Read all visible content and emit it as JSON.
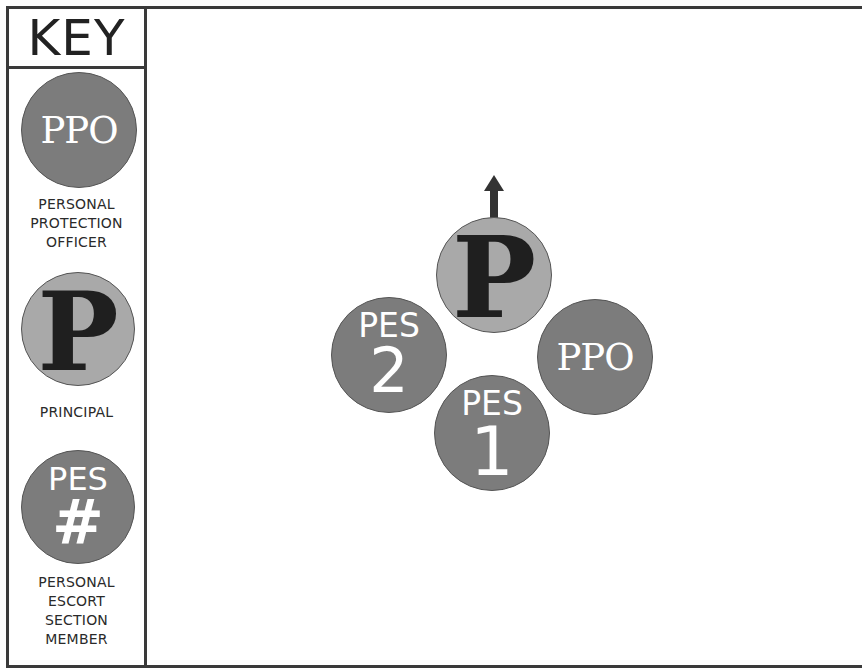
{
  "key": {
    "title": "KEY",
    "items": [
      {
        "symbol": "PPO",
        "caption": [
          "PERSONAL",
          "PROTECTION",
          "OFFICER"
        ]
      },
      {
        "symbol": "P",
        "caption": [
          "PRINCIPAL"
        ]
      },
      {
        "symbol_top": "PES",
        "symbol_bottom": "#",
        "caption": [
          "PERSONAL",
          "ESCORT",
          "SECTION",
          "MEMBER"
        ]
      }
    ]
  },
  "formation": {
    "principal": {
      "label": "P",
      "direction": "up-arrow"
    },
    "ppo": {
      "label": "PPO"
    },
    "pes1": {
      "top": "PES",
      "number": "1"
    },
    "pes2": {
      "top": "PES",
      "number": "2"
    }
  },
  "colors": {
    "dark_circle": "#7c7c7c",
    "light_circle": "#a9a9a9",
    "border": "#3a3a3a"
  }
}
